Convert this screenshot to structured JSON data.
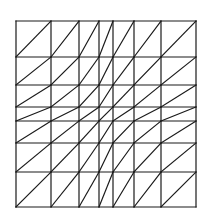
{
  "diagram": {
    "type": "triangulated-mesh",
    "grid_x": [
      16,
      51,
      79,
      99,
      113,
      134,
      161,
      196
    ],
    "grid_y": [
      21,
      57,
      85,
      107,
      121,
      143,
      172,
      207
    ],
    "diagonal_direction": "bottom-left-to-top-right",
    "stroke_color": "#1a1a1a",
    "stroke_width": 1.2,
    "background": "#ffffff"
  }
}
